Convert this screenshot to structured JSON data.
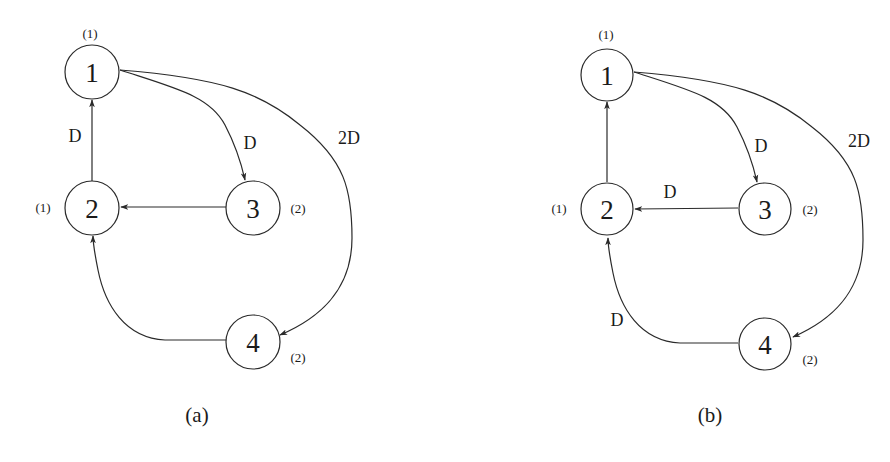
{
  "figure": {
    "panels": [
      {
        "caption": "(a)",
        "nodes": [
          {
            "id": "1",
            "label": "1",
            "weight": "(1)"
          },
          {
            "id": "2",
            "label": "2",
            "weight": "(1)"
          },
          {
            "id": "3",
            "label": "3",
            "weight": "(2)"
          },
          {
            "id": "4",
            "label": "4",
            "weight": "(2)"
          }
        ],
        "edges": [
          {
            "from": "2",
            "to": "1",
            "label": "D"
          },
          {
            "from": "1",
            "to": "3",
            "label": "D"
          },
          {
            "from": "1",
            "to": "4",
            "label": "2D"
          },
          {
            "from": "3",
            "to": "2",
            "label": ""
          },
          {
            "from": "4",
            "to": "2",
            "label": ""
          }
        ]
      },
      {
        "caption": "(b)",
        "nodes": [
          {
            "id": "1",
            "label": "1",
            "weight": "(1)"
          },
          {
            "id": "2",
            "label": "2",
            "weight": "(1)"
          },
          {
            "id": "3",
            "label": "3",
            "weight": "(2)"
          },
          {
            "id": "4",
            "label": "4",
            "weight": "(2)"
          }
        ],
        "edges": [
          {
            "from": "2",
            "to": "1",
            "label": ""
          },
          {
            "from": "1",
            "to": "3",
            "label": "D"
          },
          {
            "from": "1",
            "to": "4",
            "label": "2D"
          },
          {
            "from": "3",
            "to": "2",
            "label": "D"
          },
          {
            "from": "4",
            "to": "2",
            "label": "D"
          }
        ]
      }
    ]
  }
}
